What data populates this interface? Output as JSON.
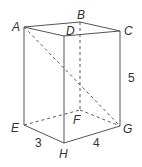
{
  "figure": {
    "type": "rectangular prism (cuboid)",
    "vertices": {
      "A": "A",
      "B": "B",
      "C": "C",
      "D": "D",
      "E": "E",
      "F": "F",
      "G": "G",
      "H": "H"
    },
    "dimensions": {
      "EH": "3",
      "HG": "4",
      "CG": "5"
    },
    "hidden_edges": [
      "BF",
      "EF",
      "FG"
    ],
    "diagonals": [
      "AG (dashed)"
    ]
  }
}
